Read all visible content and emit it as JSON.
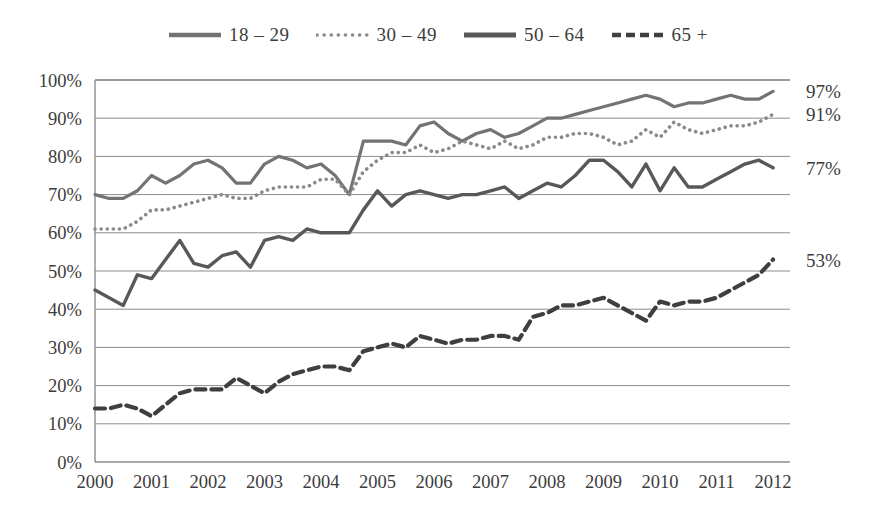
{
  "chart_data": {
    "type": "line",
    "title": "",
    "subtitle": "",
    "xlabel": "",
    "ylabel": "",
    "xlim": [
      2000,
      2012.3
    ],
    "ylim": [
      0,
      100
    ],
    "grid": true,
    "legend_position": "top-center",
    "ytick_labels": [
      "0%",
      "10%",
      "20%",
      "30%",
      "40%",
      "50%",
      "60%",
      "70%",
      "80%",
      "90%",
      "100%"
    ],
    "ytick_values": [
      0,
      10,
      20,
      30,
      40,
      50,
      60,
      70,
      80,
      90,
      100
    ],
    "xtick_labels": [
      "2000",
      "2001",
      "2002",
      "2003",
      "2004",
      "2005",
      "2006",
      "2007",
      "2008",
      "2009",
      "2010",
      "2011",
      "2012"
    ],
    "xtick_values": [
      2000,
      2001,
      2002,
      2003,
      2004,
      2005,
      2006,
      2007,
      2008,
      2009,
      2010,
      2011,
      2012
    ],
    "series": [
      {
        "name": "18-29",
        "style": "solid",
        "color": "#737373",
        "end_label": "97%",
        "x": [
          2000.0,
          2000.25,
          2000.5,
          2000.75,
          2001.0,
          2001.25,
          2001.5,
          2001.75,
          2002.0,
          2002.25,
          2002.5,
          2002.75,
          2003.0,
          2003.25,
          2003.5,
          2003.75,
          2004.0,
          2004.25,
          2004.5,
          2004.75,
          2005.0,
          2005.25,
          2005.5,
          2005.75,
          2006.0,
          2006.25,
          2006.5,
          2006.75,
          2007.0,
          2007.25,
          2007.5,
          2007.75,
          2008.0,
          2008.25,
          2008.5,
          2008.75,
          2009.0,
          2009.25,
          2009.5,
          2009.75,
          2010.0,
          2010.25,
          2010.5,
          2010.75,
          2011.0,
          2011.25,
          2011.5,
          2011.75,
          2012.0
        ],
        "values": [
          70,
          69,
          69,
          71,
          75,
          73,
          75,
          78,
          79,
          77,
          73,
          73,
          78,
          80,
          79,
          77,
          78,
          75,
          70,
          84,
          84,
          84,
          83,
          88,
          89,
          86,
          84,
          86,
          87,
          85,
          86,
          88,
          90,
          90,
          91,
          92,
          93,
          94,
          95,
          96,
          95,
          93,
          94,
          94,
          95,
          96,
          95,
          95,
          97
        ]
      },
      {
        "name": "30-49",
        "style": "dotted",
        "color": "#8a8a8a",
        "end_label": "91%",
        "x": [
          2000.0,
          2000.25,
          2000.5,
          2000.75,
          2001.0,
          2001.25,
          2001.5,
          2001.75,
          2002.0,
          2002.25,
          2002.5,
          2002.75,
          2003.0,
          2003.25,
          2003.5,
          2003.75,
          2004.0,
          2004.25,
          2004.5,
          2004.75,
          2005.0,
          2005.25,
          2005.5,
          2005.75,
          2006.0,
          2006.25,
          2006.5,
          2006.75,
          2007.0,
          2007.25,
          2007.5,
          2007.75,
          2008.0,
          2008.25,
          2008.5,
          2008.75,
          2009.0,
          2009.25,
          2009.5,
          2009.75,
          2010.0,
          2010.25,
          2010.5,
          2010.75,
          2011.0,
          2011.25,
          2011.5,
          2011.75,
          2012.0
        ],
        "values": [
          61,
          61,
          61,
          63,
          66,
          66,
          67,
          68,
          69,
          70,
          69,
          69,
          71,
          72,
          72,
          72,
          74,
          74,
          70,
          76,
          79,
          81,
          81,
          83,
          81,
          82,
          84,
          83,
          82,
          84,
          82,
          83,
          85,
          85,
          86,
          86,
          85,
          83,
          84,
          87,
          85,
          89,
          87,
          86,
          87,
          88,
          88,
          89,
          91
        ]
      },
      {
        "name": "50-64",
        "style": "solid-thick",
        "color": "#585858",
        "end_label": "77%",
        "x": [
          2000.0,
          2000.25,
          2000.5,
          2000.75,
          2001.0,
          2001.25,
          2001.5,
          2001.75,
          2002.0,
          2002.25,
          2002.5,
          2002.75,
          2003.0,
          2003.25,
          2003.5,
          2003.75,
          2004.0,
          2004.25,
          2004.5,
          2004.75,
          2005.0,
          2005.25,
          2005.5,
          2005.75,
          2006.0,
          2006.25,
          2006.5,
          2006.75,
          2007.0,
          2007.25,
          2007.5,
          2007.75,
          2008.0,
          2008.25,
          2008.5,
          2008.75,
          2009.0,
          2009.25,
          2009.5,
          2009.75,
          2010.0,
          2010.25,
          2010.5,
          2010.75,
          2011.0,
          2011.25,
          2011.5,
          2011.75,
          2012.0
        ],
        "values": [
          45,
          43,
          41,
          49,
          48,
          53,
          58,
          52,
          51,
          54,
          55,
          51,
          58,
          59,
          58,
          61,
          60,
          60,
          60,
          66,
          71,
          67,
          70,
          71,
          70,
          69,
          70,
          70,
          71,
          72,
          69,
          71,
          73,
          72,
          75,
          79,
          79,
          76,
          72,
          78,
          71,
          77,
          72,
          72,
          74,
          76,
          78,
          79,
          77
        ]
      },
      {
        "name": "65+",
        "style": "dashed",
        "color": "#3f3f3f",
        "end_label": "53%",
        "x": [
          2000.0,
          2000.25,
          2000.5,
          2000.75,
          2001.0,
          2001.25,
          2001.5,
          2001.75,
          2002.0,
          2002.25,
          2002.5,
          2002.75,
          2003.0,
          2003.25,
          2003.5,
          2003.75,
          2004.0,
          2004.25,
          2004.5,
          2004.75,
          2005.0,
          2005.25,
          2005.5,
          2005.75,
          2006.0,
          2006.25,
          2006.5,
          2006.75,
          2007.0,
          2007.25,
          2007.5,
          2007.75,
          2008.0,
          2008.25,
          2008.5,
          2008.75,
          2009.0,
          2009.25,
          2009.5,
          2009.75,
          2010.0,
          2010.25,
          2010.5,
          2010.75,
          2011.0,
          2011.25,
          2011.5,
          2011.75,
          2012.0
        ],
        "values": [
          14,
          14,
          15,
          14,
          12,
          15,
          18,
          19,
          19,
          19,
          22,
          20,
          18,
          21,
          23,
          24,
          25,
          25,
          24,
          29,
          30,
          31,
          30,
          33,
          32,
          31,
          32,
          32,
          33,
          33,
          32,
          38,
          39,
          41,
          41,
          42,
          43,
          41,
          39,
          37,
          42,
          41,
          42,
          42,
          43,
          45,
          47,
          49,
          53
        ]
      }
    ]
  },
  "legend": {
    "items": [
      {
        "label": "18 – 29",
        "swatch": "solid-line-swatch"
      },
      {
        "label": "30 – 49",
        "swatch": "dotted-line-swatch"
      },
      {
        "label": "50 – 64",
        "swatch": "solid-thick-line-swatch"
      },
      {
        "label": "65 +",
        "swatch": "dashed-line-swatch"
      }
    ]
  },
  "axes": {
    "y_labels": [
      "100%",
      "90%",
      "80%",
      "70%",
      "60%",
      "50%",
      "40%",
      "30%",
      "20%",
      "10%",
      "0%"
    ],
    "x_labels": [
      "2000",
      "2001",
      "2002",
      "2003",
      "2004",
      "2005",
      "2006",
      "2007",
      "2008",
      "2009",
      "2010",
      "2011",
      "2012"
    ]
  },
  "end_labels": [
    {
      "series": "18-29",
      "text": "97%"
    },
    {
      "series": "30-49",
      "text": "91%"
    },
    {
      "series": "50-64",
      "text": "77%"
    },
    {
      "series": "65+",
      "text": "53%"
    }
  ],
  "colors": {
    "grid": "#8c8c8c",
    "axis": "#8c8c8c",
    "text": "#3c3c3c",
    "background": "#ffffff"
  }
}
